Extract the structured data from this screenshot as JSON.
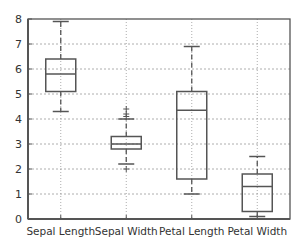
{
  "chart_data": {
    "type": "box",
    "title": "",
    "xlabel": "",
    "ylabel": "",
    "ylim": [
      0,
      8
    ],
    "yticks": [
      0,
      1,
      2,
      3,
      4,
      5,
      6,
      7,
      8
    ],
    "grid": true,
    "legend": null,
    "categories": [
      "Sepal Length",
      "Sepal Width",
      "Petal Length",
      "Petal Width"
    ],
    "boxes": [
      {
        "name": "Sepal Length",
        "whisker_low": 4.3,
        "q1": 5.1,
        "median": 5.8,
        "q3": 6.4,
        "whisker_high": 7.9,
        "outliers": []
      },
      {
        "name": "Sepal Width",
        "whisker_low": 2.2,
        "q1": 2.8,
        "median": 3.0,
        "q3": 3.3,
        "whisker_high": 4.0,
        "outliers": [
          2.0,
          4.1,
          4.2,
          4.4
        ]
      },
      {
        "name": "Petal Length",
        "whisker_low": 1.0,
        "q1": 1.6,
        "median": 4.35,
        "q3": 5.1,
        "whisker_high": 6.9,
        "outliers": []
      },
      {
        "name": "Petal Width",
        "whisker_low": 0.1,
        "q1": 0.3,
        "median": 1.3,
        "q3": 1.8,
        "whisker_high": 2.5,
        "outliers": []
      }
    ]
  },
  "style": {
    "axis_color": "#555555",
    "box_color": "#555555",
    "grid_color": "#999999",
    "background": "#ffffff"
  }
}
